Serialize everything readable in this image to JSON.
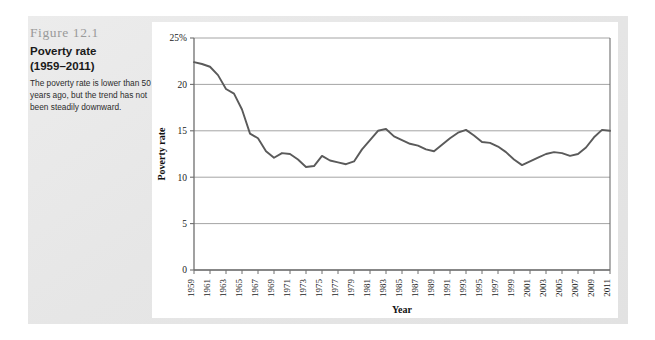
{
  "figure": {
    "number": "Figure 12.1",
    "title": "Poverty rate",
    "years": "(1959–2011)",
    "description": "The poverty rate is lower than 50 years ago, but the trend has not been steadily downward."
  },
  "colors": {
    "panel_background": "#ffffff",
    "figure_background": "#e8e8e8",
    "line": "#5a5a5a",
    "gridline": "#9a9a9a",
    "axis": "#6e6e6e",
    "figure_number_text": "#9a9a9a",
    "text": "#1a1a1a"
  },
  "chart_data": {
    "type": "line",
    "title": "Poverty rate (1959–2011)",
    "xlabel": "Year",
    "ylabel": "Poverty rate",
    "ylim": [
      0,
      25
    ],
    "xlim": [
      1959,
      2011
    ],
    "grid": true,
    "legend": "none",
    "y_ticks": [
      "0",
      "5",
      "10",
      "15",
      "20",
      "25%"
    ],
    "y_tick_values": [
      0,
      5,
      10,
      15,
      20,
      25
    ],
    "x_ticks": [
      "1959",
      "1961",
      "1963",
      "1965",
      "1967",
      "1969",
      "1971",
      "1973",
      "1975",
      "1977",
      "1979",
      "1981",
      "1983",
      "1985",
      "1987",
      "1989",
      "1991",
      "1993",
      "1995",
      "1997",
      "1999",
      "2001",
      "2003",
      "2005",
      "2007",
      "2009",
      "2011"
    ],
    "x": [
      1959,
      1960,
      1961,
      1962,
      1963,
      1964,
      1965,
      1966,
      1967,
      1968,
      1969,
      1970,
      1971,
      1972,
      1973,
      1974,
      1975,
      1976,
      1977,
      1978,
      1979,
      1980,
      1981,
      1982,
      1983,
      1984,
      1985,
      1986,
      1987,
      1988,
      1989,
      1990,
      1991,
      1992,
      1993,
      1994,
      1995,
      1996,
      1997,
      1998,
      1999,
      2000,
      2001,
      2002,
      2003,
      2004,
      2005,
      2006,
      2007,
      2008,
      2009,
      2010,
      2011
    ],
    "values": [
      22.4,
      22.2,
      21.9,
      21.0,
      19.5,
      19.0,
      17.3,
      14.7,
      14.2,
      12.8,
      12.1,
      12.6,
      12.5,
      11.9,
      11.1,
      11.2,
      12.3,
      11.8,
      11.6,
      11.4,
      11.7,
      13.0,
      14.0,
      15.0,
      15.2,
      14.4,
      14.0,
      13.6,
      13.4,
      13.0,
      12.8,
      13.5,
      14.2,
      14.8,
      15.1,
      14.5,
      13.8,
      13.7,
      13.3,
      12.7,
      11.9,
      11.3,
      11.7,
      12.1,
      12.5,
      12.7,
      12.6,
      12.3,
      12.5,
      13.2,
      14.3,
      15.1,
      15.0
    ],
    "series": [
      {
        "name": "Poverty rate",
        "values": [
          22.4,
          22.2,
          21.9,
          21.0,
          19.5,
          19.0,
          17.3,
          14.7,
          14.2,
          12.8,
          12.1,
          12.6,
          12.5,
          11.9,
          11.1,
          11.2,
          12.3,
          11.8,
          11.6,
          11.4,
          11.7,
          13.0,
          14.0,
          15.0,
          15.2,
          14.4,
          14.0,
          13.6,
          13.4,
          13.0,
          12.8,
          13.5,
          14.2,
          14.8,
          15.1,
          14.5,
          13.8,
          13.7,
          13.3,
          12.7,
          11.9,
          11.3,
          11.7,
          12.1,
          12.5,
          12.7,
          12.6,
          12.3,
          12.5,
          13.2,
          14.3,
          15.1,
          15.0
        ]
      }
    ]
  }
}
